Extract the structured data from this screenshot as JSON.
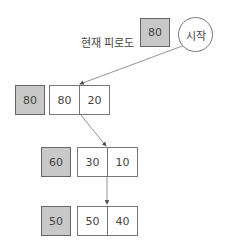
{
  "header": {
    "label": "현재 피로도",
    "current_fatigue": "80",
    "start_label": "시작"
  },
  "rows": [
    {
      "fatigue": "80",
      "cells": [
        "80",
        "20"
      ]
    },
    {
      "fatigue": "60",
      "cells": [
        "30",
        "10"
      ]
    },
    {
      "fatigue": "50",
      "cells": [
        "50",
        "40"
      ]
    }
  ],
  "colors": {
    "gray": "#c8c8c8",
    "border": "#777777",
    "arrow": "#666666"
  }
}
